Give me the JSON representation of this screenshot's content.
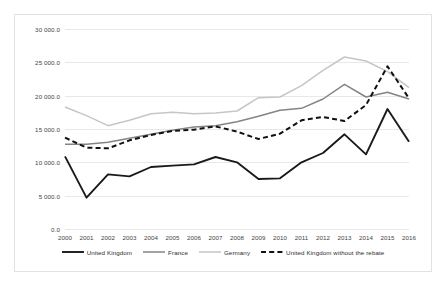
{
  "chart_data": {
    "type": "line",
    "title": "",
    "subtitle": "",
    "xlabel": "",
    "ylabel": "",
    "grid": true,
    "legend_position": "bottom",
    "categories": [
      "2000",
      "2001",
      "2002",
      "2003",
      "2004",
      "2005",
      "2006",
      "2007",
      "2008",
      "2009",
      "2010",
      "2011",
      "2012",
      "2013",
      "2014",
      "2015",
      "2016"
    ],
    "xlim": [
      2000,
      2016
    ],
    "ylim": [
      0,
      30000
    ],
    "yticks": [
      0,
      5000,
      10000,
      15000,
      20000,
      25000,
      30000
    ],
    "ytick_labels": [
      "0.0",
      "5 000.0",
      "10 000.0",
      "15 000.0",
      "20 000.0",
      "25 000.0",
      "30 000.0"
    ],
    "series": [
      {
        "name": "United Kingdom",
        "color": "#1a1a1a",
        "style": "solid",
        "width": 1.9,
        "values": [
          10900,
          4700,
          8200,
          7900,
          9300,
          9500,
          9700,
          10800,
          10000,
          7500,
          7600,
          10000,
          11400,
          14200,
          11200,
          18000,
          13100
        ]
      },
      {
        "name": "France",
        "color": "#848484",
        "style": "solid",
        "width": 1.5,
        "values": [
          12700,
          12700,
          13000,
          13600,
          14200,
          14800,
          15300,
          15500,
          16100,
          16900,
          17800,
          18100,
          19500,
          21700,
          19800,
          20500,
          19500
        ]
      },
      {
        "name": "Germany",
        "color": "#c6c6c6",
        "style": "solid",
        "width": 1.5,
        "values": [
          18300,
          17000,
          15500,
          16300,
          17300,
          17500,
          17300,
          17400,
          17700,
          19700,
          19800,
          21500,
          23800,
          25800,
          25200,
          23600,
          21200
        ]
      },
      {
        "name": "United Kingdom without the rebate",
        "color": "#111111",
        "style": "dashed",
        "width": 2.0,
        "values": [
          13700,
          12200,
          12100,
          13300,
          14100,
          14700,
          14900,
          15400,
          14600,
          13500,
          14300,
          16300,
          16800,
          16200,
          18600,
          24400,
          19600
        ]
      }
    ]
  },
  "legend": {
    "items": [
      {
        "label": "United Kingdom"
      },
      {
        "label": "France"
      },
      {
        "label": "Germany"
      },
      {
        "label": "United Kingdom without the rebate"
      }
    ]
  }
}
